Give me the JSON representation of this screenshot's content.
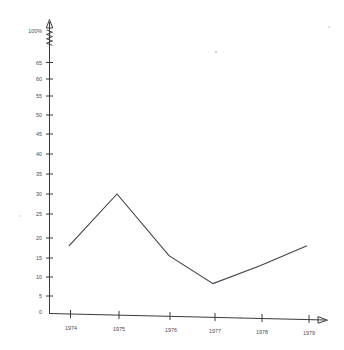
{
  "chart_data": {
    "type": "line",
    "title": "",
    "subtitle": "",
    "xlabel": "",
    "ylabel": "",
    "categories": [
      "1974",
      "1975",
      "1976",
      "1977",
      "1978",
      "1979"
    ],
    "x": [
      1974,
      1975,
      1976,
      1977,
      1978,
      1979
    ],
    "values": [
      17,
      30,
      14.5,
      7.5,
      12,
      17
    ],
    "series": [
      {
        "name": "",
        "values": [
          17,
          30,
          14.5,
          7.5,
          12,
          17
        ]
      }
    ],
    "ylim": [
      0,
      65
    ],
    "y_ticks": [
      0,
      5,
      10,
      15,
      20,
      25,
      30,
      35,
      40,
      45,
      50,
      55,
      60,
      65
    ],
    "y_tick_labels": [
      "0",
      "5",
      "10",
      "15",
      "20",
      "25",
      "30",
      "35",
      "40",
      "45",
      "50",
      "55",
      "60",
      "65"
    ],
    "y_axis_top_label": "100%",
    "y_axis_break": true,
    "x_tick_labels": [
      "1974",
      "1975",
      "1976",
      "1977",
      "1978",
      "1979"
    ],
    "grid": false,
    "legend": null,
    "legend_position": "none",
    "line_color": "#40404a",
    "axis_color": "#3a3a3a",
    "background_color": "#ffffff",
    "annotations": []
  },
  "axes": {
    "y_labels": [
      {
        "text": "100%",
        "y": 31
      },
      {
        "text": "65",
        "y": 63
      },
      {
        "text": "60",
        "y": 79
      },
      {
        "text": "55",
        "y": 96
      },
      {
        "text": "50",
        "y": 115
      },
      {
        "text": "45",
        "y": 134
      },
      {
        "text": "40",
        "y": 154
      },
      {
        "text": "35",
        "y": 174
      },
      {
        "text": "30",
        "y": 194
      },
      {
        "text": "25",
        "y": 214
      },
      {
        "text": "20",
        "y": 238
      },
      {
        "text": "15",
        "y": 258
      },
      {
        "text": "10",
        "y": 277
      },
      {
        "text": "5",
        "y": 296
      },
      {
        "text": "0",
        "y": 312
      }
    ],
    "x_labels": [
      {
        "text": "1974",
        "x": 71,
        "y": 327
      },
      {
        "text": "1975",
        "x": 119,
        "y": 328
      },
      {
        "text": "1976",
        "x": 171,
        "y": 329
      },
      {
        "text": "1977",
        "x": 215,
        "y": 330
      },
      {
        "text": "1978",
        "x": 262,
        "y": 331
      },
      {
        "text": "1979",
        "x": 309,
        "y": 332
      }
    ]
  }
}
